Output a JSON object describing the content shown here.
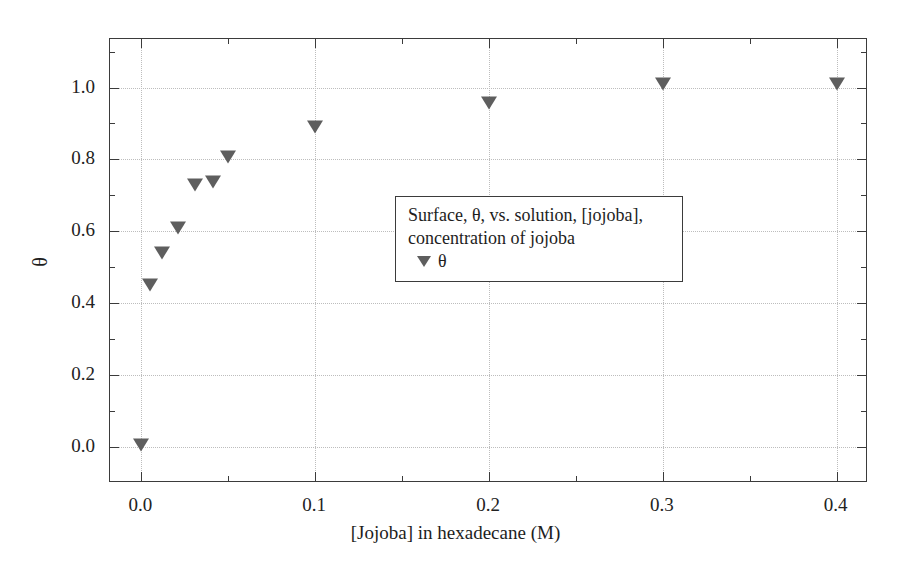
{
  "chart_data": {
    "type": "scatter",
    "title": "",
    "xlabel": "[Jojoba] in hexadecane (M)",
    "ylabel": "θ",
    "xlim": [
      -0.018,
      0.418
    ],
    "ylim": [
      -0.1,
      1.135
    ],
    "grid": true,
    "xticks": [
      "0.0",
      "0.1",
      "0.2",
      "0.3",
      "0.4"
    ],
    "xtick_values": [
      0.0,
      0.1,
      0.2,
      0.3,
      0.4
    ],
    "yticks": [
      "0.0",
      "0.2",
      "0.4",
      "0.6",
      "0.8",
      "1.0"
    ],
    "ytick_values": [
      0.0,
      0.2,
      0.4,
      0.6,
      0.8,
      1.0
    ],
    "x_minor_ticks": [
      0.05,
      0.15,
      0.25,
      0.35
    ],
    "y_minor_ticks": [
      0.1,
      0.3,
      0.5,
      0.7,
      0.9,
      1.1
    ],
    "marker": "triangle-down",
    "marker_color": "#5e5e5e",
    "series": [
      {
        "name": "θ",
        "x": [
          0.0,
          0.005,
          0.012,
          0.021,
          0.031,
          0.041,
          0.05,
          0.1,
          0.2,
          0.3,
          0.4
        ],
        "y": [
          0.005,
          0.45,
          0.54,
          0.61,
          0.728,
          0.738,
          0.806,
          0.89,
          0.958,
          1.01,
          1.01
        ]
      }
    ],
    "legend": {
      "position": "center",
      "description_lines": [
        "Surface, θ, vs. solution, [jojoba],",
        "concentration of jojoba"
      ],
      "entries": [
        {
          "label": "θ",
          "marker": "triangle-down"
        }
      ]
    }
  }
}
